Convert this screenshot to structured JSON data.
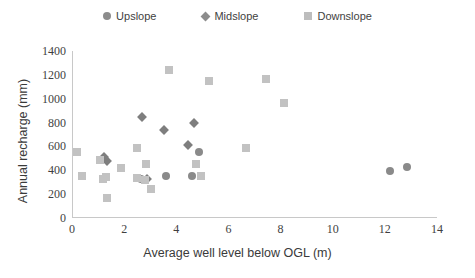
{
  "chart_data": {
    "type": "scatter",
    "title": "",
    "xlabel": "Average well level below OGL (m)",
    "ylabel": "Annual recharge (mm)",
    "xlim": [
      0,
      14
    ],
    "ylim": [
      0,
      1400
    ],
    "xticks": [
      0,
      2,
      4,
      6,
      8,
      10,
      12,
      14
    ],
    "yticks": [
      0,
      200,
      400,
      600,
      800,
      1000,
      1200,
      1400
    ],
    "grid": false,
    "legend_position": "top-center",
    "series": [
      {
        "name": "Upslope",
        "marker": "circle",
        "color": "#8a8a8a",
        "points": [
          {
            "x": 2.6,
            "y": 330
          },
          {
            "x": 3.55,
            "y": 355
          },
          {
            "x": 4.85,
            "y": 555
          },
          {
            "x": 4.55,
            "y": 350
          },
          {
            "x": 12.15,
            "y": 395
          },
          {
            "x": 12.8,
            "y": 430
          }
        ]
      },
      {
        "name": "Midslope",
        "marker": "diamond",
        "color": "#7e7e7e",
        "points": [
          {
            "x": 1.2,
            "y": 510
          },
          {
            "x": 1.3,
            "y": 480
          },
          {
            "x": 2.65,
            "y": 850
          },
          {
            "x": 3.5,
            "y": 740
          },
          {
            "x": 4.4,
            "y": 615
          },
          {
            "x": 4.65,
            "y": 800
          },
          {
            "x": 2.85,
            "y": 330
          }
        ]
      },
      {
        "name": "Downslope",
        "marker": "square",
        "color": "#c2c2c2",
        "points": [
          {
            "x": 0.15,
            "y": 555
          },
          {
            "x": 0.35,
            "y": 355
          },
          {
            "x": 1.05,
            "y": 490
          },
          {
            "x": 1.25,
            "y": 345
          },
          {
            "x": 1.15,
            "y": 330
          },
          {
            "x": 1.3,
            "y": 170
          },
          {
            "x": 1.85,
            "y": 420
          },
          {
            "x": 2.45,
            "y": 590
          },
          {
            "x": 2.45,
            "y": 335
          },
          {
            "x": 2.8,
            "y": 450
          },
          {
            "x": 2.75,
            "y": 315
          },
          {
            "x": 3.0,
            "y": 240
          },
          {
            "x": 3.7,
            "y": 1240
          },
          {
            "x": 5.2,
            "y": 1150
          },
          {
            "x": 4.7,
            "y": 455
          },
          {
            "x": 4.9,
            "y": 355
          },
          {
            "x": 6.65,
            "y": 590
          },
          {
            "x": 7.4,
            "y": 1165
          },
          {
            "x": 8.1,
            "y": 960
          }
        ]
      }
    ]
  },
  "legend": {
    "items": [
      {
        "label": "Upslope",
        "marker": "circle-icon"
      },
      {
        "label": "Midslope",
        "marker": "diamond-icon"
      },
      {
        "label": "Downslope",
        "marker": "square-icon"
      }
    ]
  }
}
